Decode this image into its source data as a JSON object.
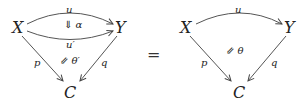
{
  "left_diagram": {
    "nodes": {
      "X": "X",
      "Y": "Y",
      "C": "C"
    },
    "arrows": {
      "top": "u",
      "middle": "u′",
      "left": "p",
      "right": "q"
    },
    "two_cells": {
      "upper": "⇓ α",
      "lower": "⇙ θ′"
    }
  },
  "equals": "=",
  "right_diagram": {
    "nodes": {
      "X": "X",
      "Y": "Y",
      "C": "C"
    },
    "arrows": {
      "top": "u",
      "left": "p",
      "right": "q"
    },
    "two_cells": {
      "main": "⇙ θ"
    }
  }
}
